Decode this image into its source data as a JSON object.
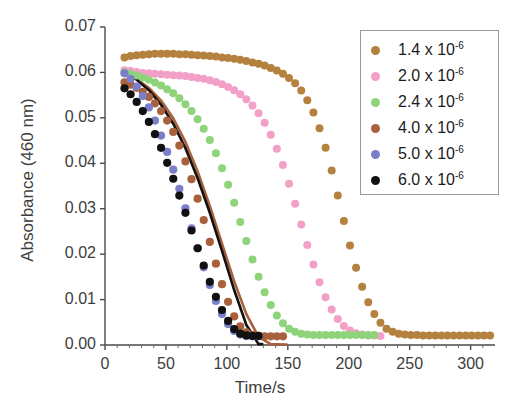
{
  "chart_data": {
    "type": "scatter",
    "title": "",
    "xlabel": "Time/s",
    "ylabel": "Absorbance (460 nm)",
    "xlim": [
      0,
      320
    ],
    "ylim": [
      0.0,
      0.07
    ],
    "xticks": [
      0,
      50,
      100,
      150,
      200,
      250,
      300
    ],
    "xtick_labels": [
      "0",
      "50",
      "100",
      "150",
      "200",
      "250",
      "300"
    ],
    "yticks": [
      0.0,
      0.01,
      0.02,
      0.03,
      0.04,
      0.05,
      0.06,
      0.07
    ],
    "ytick_labels": [
      "0.00",
      "0.01",
      "0.02",
      "0.03",
      "0.04",
      "0.05",
      "0.06",
      "0.07"
    ],
    "grid": false,
    "legend_position": "upper right",
    "marker_shape": "circle",
    "series": [
      {
        "name": "1.4 x 10",
        "exponent": "-6",
        "color": "#b5813f",
        "has_fit_line": false,
        "x": [
          16,
          21,
          26,
          31,
          36,
          41,
          46,
          51,
          56,
          61,
          66,
          71,
          76,
          81,
          86,
          91,
          96,
          101,
          106,
          111,
          116,
          121,
          126,
          131,
          136,
          141,
          146,
          151,
          156,
          161,
          166,
          171,
          176,
          181,
          186,
          191,
          196,
          201,
          206,
          211,
          216,
          221,
          226,
          231,
          236,
          241,
          246,
          251,
          256,
          261,
          266,
          271,
          276,
          281,
          286,
          291,
          296,
          301,
          306,
          311,
          316
        ],
        "y": [
          0.0633,
          0.0636,
          0.0638,
          0.0639,
          0.064,
          0.0641,
          0.0641,
          0.0641,
          0.0641,
          0.064,
          0.064,
          0.0639,
          0.0638,
          0.0637,
          0.0636,
          0.0635,
          0.0633,
          0.0632,
          0.063,
          0.0628,
          0.0625,
          0.0622,
          0.0619,
          0.0615,
          0.061,
          0.0604,
          0.0597,
          0.0588,
          0.0576,
          0.056,
          0.0539,
          0.0512,
          0.0477,
          0.0434,
          0.0384,
          0.0329,
          0.0273,
          0.0219,
          0.017,
          0.0128,
          0.0094,
          0.0068,
          0.0049,
          0.0036,
          0.0029,
          0.0025,
          0.0023,
          0.0022,
          0.0022,
          0.0021,
          0.0021,
          0.0021,
          0.0021,
          0.0021,
          0.0021,
          0.0021,
          0.0021,
          0.0021,
          0.0021,
          0.0021,
          0.0021
        ]
      },
      {
        "name": "2.0 x 10",
        "exponent": "-6",
        "color": "#f2a0c8",
        "has_fit_line": false,
        "x": [
          16,
          21,
          26,
          31,
          36,
          41,
          46,
          51,
          56,
          61,
          66,
          71,
          76,
          81,
          86,
          91,
          96,
          101,
          106,
          111,
          116,
          121,
          126,
          131,
          136,
          141,
          146,
          151,
          156,
          161,
          166,
          171,
          176,
          181,
          186,
          191,
          196,
          201,
          206,
          211,
          216,
          221,
          226
        ],
        "y": [
          0.0605,
          0.0603,
          0.0601,
          0.0599,
          0.0598,
          0.0597,
          0.0596,
          0.0595,
          0.0594,
          0.0593,
          0.0592,
          0.059,
          0.0588,
          0.0586,
          0.0583,
          0.0579,
          0.0574,
          0.0568,
          0.0561,
          0.0552,
          0.0541,
          0.0527,
          0.051,
          0.0489,
          0.0463,
          0.0432,
          0.0396,
          0.0355,
          0.0311,
          0.0265,
          0.022,
          0.0177,
          0.0138,
          0.0105,
          0.0078,
          0.0057,
          0.0042,
          0.0032,
          0.0026,
          0.0023,
          0.0021,
          0.0021,
          0.002
        ]
      },
      {
        "name": "2.4 x 10",
        "exponent": "-6",
        "color": "#8fd37a",
        "has_fit_line": false,
        "x": [
          16,
          21,
          26,
          31,
          36,
          41,
          46,
          51,
          56,
          61,
          66,
          71,
          76,
          81,
          86,
          91,
          96,
          101,
          106,
          111,
          116,
          121,
          126,
          131,
          136,
          141,
          146,
          151,
          156,
          161,
          166,
          171,
          176,
          181,
          186,
          191,
          196,
          201,
          206,
          211,
          216,
          221
        ],
        "y": [
          0.06,
          0.0597,
          0.0593,
          0.0589,
          0.0584,
          0.0578,
          0.0571,
          0.0563,
          0.0554,
          0.0543,
          0.053,
          0.0515,
          0.0497,
          0.0476,
          0.0451,
          0.0422,
          0.0389,
          0.0353,
          0.0313,
          0.0271,
          0.0229,
          0.0188,
          0.015,
          0.0116,
          0.0088,
          0.0065,
          0.0048,
          0.0036,
          0.0029,
          0.0025,
          0.0023,
          0.0022,
          0.0022,
          0.0022,
          0.0022,
          0.0022,
          0.0022,
          0.0022,
          0.0022,
          0.0022,
          0.0022,
          0.0022
        ]
      },
      {
        "name": "4.0 x 10",
        "exponent": "-6",
        "color": "#a9603c",
        "has_fit_line": true,
        "x": [
          16,
          21,
          26,
          31,
          36,
          41,
          46,
          51,
          56,
          61,
          66,
          71,
          76,
          81,
          86,
          91,
          96,
          101,
          106,
          111,
          116,
          121,
          126,
          131,
          136,
          141,
          146
        ],
        "y": [
          0.0578,
          0.0573,
          0.0566,
          0.0557,
          0.0546,
          0.0532,
          0.0515,
          0.0494,
          0.0469,
          0.0439,
          0.0404,
          0.0365,
          0.0322,
          0.0275,
          0.0227,
          0.0179,
          0.0134,
          0.0095,
          0.0063,
          0.0041,
          0.0028,
          0.0022,
          0.002,
          0.0019,
          0.0019,
          0.0019,
          0.0019
        ]
      },
      {
        "name": "5.0 x 10",
        "exponent": "-6",
        "color": "#7b7ec9",
        "has_fit_line": false,
        "x": [
          16,
          21,
          26,
          31,
          36,
          41,
          46,
          51,
          56,
          61,
          66,
          71,
          76,
          81,
          86,
          91,
          96,
          101,
          106,
          111,
          116,
          121,
          126
        ],
        "y": [
          0.0598,
          0.0586,
          0.0569,
          0.0548,
          0.0523,
          0.0494,
          0.0461,
          0.0425,
          0.0386,
          0.0344,
          0.0301,
          0.0257,
          0.0213,
          0.0171,
          0.0132,
          0.0097,
          0.0068,
          0.0046,
          0.0031,
          0.0023,
          0.002,
          0.0019,
          0.0019
        ]
      },
      {
        "name": "6.0 x 10",
        "exponent": "-6",
        "color": "#111111",
        "has_fit_line": true,
        "x": [
          16,
          21,
          26,
          31,
          36,
          41,
          46,
          51,
          56,
          61,
          66,
          71,
          76,
          81,
          86,
          91,
          96,
          101,
          106,
          111,
          116,
          121,
          126
        ],
        "y": [
          0.0565,
          0.0552,
          0.0535,
          0.0515,
          0.0491,
          0.0464,
          0.0434,
          0.0401,
          0.0366,
          0.0329,
          0.0291,
          0.0252,
          0.0213,
          0.0175,
          0.0139,
          0.0106,
          0.0077,
          0.0053,
          0.0035,
          0.0025,
          0.0021,
          0.002,
          0.002
        ]
      }
    ],
    "fit_lines": [
      {
        "name": "fit-4.0",
        "color": "#a9603c",
        "x": [
          16,
          26,
          36,
          46,
          56,
          66,
          76,
          86,
          96,
          106,
          116,
          126,
          136,
          146
        ],
        "y": [
          0.0598,
          0.0585,
          0.0566,
          0.0538,
          0.0499,
          0.0447,
          0.0382,
          0.0306,
          0.0223,
          0.014,
          0.0068,
          0.0018,
          0.0002,
          0.0001
        ]
      },
      {
        "name": "fit-6.0",
        "color": "#111111",
        "x": [
          16,
          26,
          36,
          46,
          56,
          66,
          76,
          86,
          96,
          106,
          116,
          126
        ],
        "y": [
          0.06,
          0.0584,
          0.0561,
          0.0529,
          0.0487,
          0.0433,
          0.0367,
          0.0291,
          0.0207,
          0.0121,
          0.0044,
          0.0002
        ]
      }
    ]
  },
  "legend": {
    "entries": [
      {
        "label": "1.4 x 10",
        "exponent": "-6",
        "color": "#b5813f"
      },
      {
        "label": "2.0 x 10",
        "exponent": "-6",
        "color": "#f2a0c8"
      },
      {
        "label": "2.4 x 10",
        "exponent": "-6",
        "color": "#8fd37a"
      },
      {
        "label": "4.0 x 10",
        "exponent": "-6",
        "color": "#a9603c"
      },
      {
        "label": "5.0 x 10",
        "exponent": "-6",
        "color": "#7b7ec9"
      },
      {
        "label": "6.0 x 10",
        "exponent": "-6",
        "color": "#111111"
      }
    ]
  }
}
